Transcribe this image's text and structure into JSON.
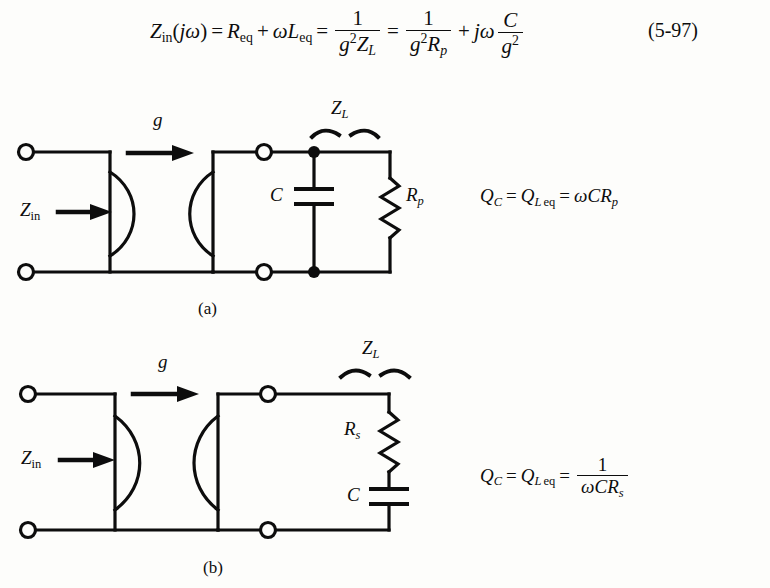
{
  "document": {
    "kind": "textbook-figure-page",
    "background_color": "#fdfdfb",
    "ink_color": "#0d0d0d"
  },
  "equation_main": {
    "id": "5-97",
    "number_label": "(5-97)",
    "plain_text": "Z_in(jω) = R_eq + ωL_eq = 1/(g²Z_L) = 1/(g²R_p) + jω C/g²",
    "terms": {
      "lhs_symbol": "Z",
      "lhs_subscript": "in",
      "lhs_arg_open": "(",
      "lhs_arg_j": "j",
      "lhs_arg_omega": "ω",
      "lhs_arg_close": ")",
      "eq1": "=",
      "r_symbol": "R",
      "r_subscript": "eq",
      "plus1": "+",
      "omega2": "ω",
      "l_symbol": "L",
      "l_subscript": "eq",
      "eq2": "=",
      "frac1_num": "1",
      "frac1_den_g": "g",
      "frac1_den_exp": "2",
      "frac1_den_z": "Z",
      "frac1_den_zsub": "L",
      "eq3": "=",
      "frac2_num": "1",
      "frac2_den_g": "g",
      "frac2_den_exp": "2",
      "frac2_den_r": "R",
      "frac2_den_rsub": "p",
      "plus2": "+",
      "j2": "j",
      "omega3": "ω",
      "frac3_num": "C",
      "frac3_den_g": "g",
      "frac3_den_exp": "2"
    }
  },
  "figure_a": {
    "caption": "(a)",
    "labels": {
      "z_in": "Z",
      "z_in_sub": "in",
      "gain": "g",
      "z_load": "Z",
      "z_load_sub": "L",
      "capacitor": "C",
      "resistor": "R",
      "resistor_sub": "p"
    },
    "equation": {
      "plain_text": "Q_C = Q_L eq = ωCR_p",
      "q1": "Q",
      "q1_sub": "C",
      "eq1": "=",
      "q2": "Q",
      "q2_sub_l": "L",
      "q2_sub_eq": "eq",
      "eq2": "=",
      "rhs_omega": "ω",
      "rhs_c": "C",
      "rhs_r": "R",
      "rhs_r_sub": "p"
    }
  },
  "figure_b": {
    "caption": "(b)",
    "labels": {
      "z_in": "Z",
      "z_in_sub": "in",
      "gain": "g",
      "z_load": "Z",
      "z_load_sub": "L",
      "resistor": "R",
      "resistor_sub": "s",
      "capacitor": "C"
    },
    "equation": {
      "plain_text": "Q_C = Q_L eq = 1/(ωCR_s)",
      "q1": "Q",
      "q1_sub": "C",
      "eq1": "=",
      "q2": "Q",
      "q2_sub_l": "L",
      "q2_sub_eq": "eq",
      "eq2": "=",
      "frac_num": "1",
      "frac_den_omega": "ω",
      "frac_den_c": "C",
      "frac_den_r": "R",
      "frac_den_r_sub": "s"
    }
  }
}
